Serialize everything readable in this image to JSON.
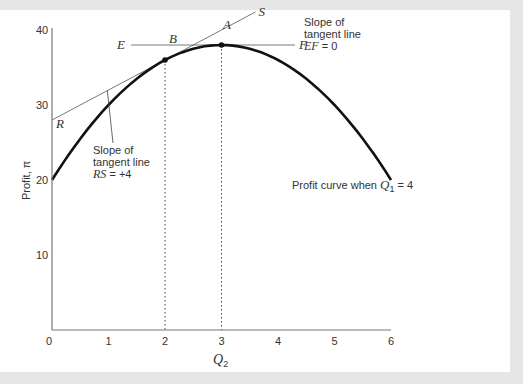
{
  "chart_data": {
    "type": "line",
    "title": "",
    "xlabel": "Q2",
    "ylabel": "Profit, π",
    "xlim": [
      0,
      6
    ],
    "ylim": [
      0,
      40
    ],
    "x_ticks": [
      0,
      1,
      2,
      3,
      4,
      5,
      6
    ],
    "y_ticks": [
      10,
      20,
      30,
      40
    ],
    "grid": false,
    "series": [
      {
        "name": "Profit curve when Q1 = 4",
        "x": [
          0,
          0.5,
          1,
          1.5,
          2,
          2.5,
          3,
          3.5,
          4,
          4.5,
          5,
          5.5,
          6
        ],
        "values": [
          20,
          25.5,
          30,
          33.5,
          36,
          37.5,
          38,
          37.5,
          36,
          33.5,
          30,
          25.5,
          20
        ]
      },
      {
        "name": "Tangent line RS",
        "x": [
          0,
          3.6
        ],
        "values": [
          28,
          42.4
        ]
      },
      {
        "name": "Tangent line EF",
        "x": [
          1.4,
          4.3
        ],
        "values": [
          38,
          38
        ]
      }
    ],
    "points": [
      {
        "label": "A",
        "x": 3,
        "y": 38
      },
      {
        "label": "B",
        "x": 2,
        "y": 36
      },
      {
        "label": "R",
        "x": 0,
        "y": 28
      },
      {
        "label": "S",
        "x": 3.6,
        "y": 42.4
      },
      {
        "label": "E",
        "x": 1.4,
        "y": 38
      },
      {
        "label": "F",
        "x": 4.3,
        "y": 38
      }
    ],
    "annotations": [
      {
        "text": "Slope of tangent line RS = +4"
      },
      {
        "text": "Slope of tangent line EF = 0"
      },
      {
        "text": "Profit curve when Q1 = 4"
      }
    ]
  },
  "labels": {
    "y_axis": "Profit, π",
    "x_axis_main": "Q",
    "x_axis_sub": "2",
    "x_ticks": [
      "0",
      "1",
      "2",
      "3",
      "4",
      "5",
      "6"
    ],
    "y_ticks": [
      "10",
      "20",
      "30",
      "40"
    ],
    "point_A": "A",
    "point_B": "B",
    "point_R": "R",
    "point_S": "S",
    "point_E": "E",
    "point_F": "F",
    "rs_note_line1": "Slope of",
    "rs_note_line2": "tangent line",
    "rs_note_line3_italic": "RS",
    "rs_note_line3_rest": " = +4",
    "ef_note_line1": "Slope of",
    "ef_note_line2": "tangent line",
    "ef_note_line3_italic": "EF",
    "ef_note_line3_rest": " = 0",
    "curve_label_prefix": "Profit curve when ",
    "curve_label_q": "Q",
    "curve_label_sub": "1",
    "curve_label_suffix": " = 4"
  }
}
